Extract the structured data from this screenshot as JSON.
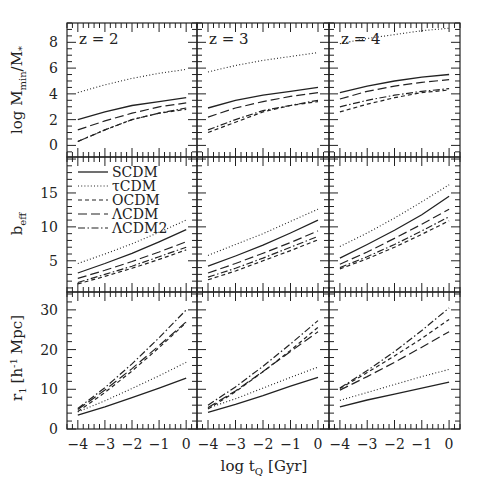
{
  "chart_data": {
    "type": "line",
    "title": "",
    "xlabel": "log t_Q [Gyr]",
    "x": [
      -4,
      -3,
      -2,
      -1,
      0
    ],
    "xlim": [
      -4.4,
      0.4
    ],
    "xticks": [
      -4,
      -3,
      -2,
      -1,
      0
    ],
    "columns": [
      "z = 2",
      "z = 3",
      "z = 4"
    ],
    "rows": [
      {
        "key": "mmin",
        "ylabel": "log M_min/M_*",
        "ylim": [
          -0.9,
          9.5
        ],
        "yticks": [
          0,
          2,
          4,
          6,
          8
        ]
      },
      {
        "key": "beff",
        "ylabel": "b_eff",
        "ylim": [
          0.4,
          20.3
        ],
        "yticks": [
          5,
          10,
          15
        ]
      },
      {
        "key": "r1",
        "ylabel": "r_1 [h^-1 Mpc]",
        "ylim": [
          0,
          34.5
        ],
        "yticks": [
          0,
          10,
          20,
          30
        ]
      }
    ],
    "legend": [
      {
        "name": "SCDM",
        "style": "solid"
      },
      {
        "name": "τCDM",
        "style": "dotted"
      },
      {
        "name": "OCDM",
        "style": "short-dash"
      },
      {
        "name": "ΛCDM",
        "style": "long-dash"
      },
      {
        "name": "ΛCDM2",
        "style": "dash-dot"
      }
    ],
    "legend_position": "middle-left panel, upper left",
    "grid": false,
    "panels": {
      "mmin": [
        {
          "z": 2,
          "series": [
            {
              "name": "SCDM",
              "values": [
                2.0,
                2.6,
                3.1,
                3.4,
                3.7
              ]
            },
            {
              "name": "τCDM",
              "values": [
                4.1,
                4.7,
                5.2,
                5.6,
                5.9
              ]
            },
            {
              "name": "OCDM",
              "values": [
                0.3,
                1.2,
                2.0,
                2.5,
                2.8
              ]
            },
            {
              "name": "ΛCDM",
              "values": [
                1.2,
                1.9,
                2.5,
                3.0,
                3.3
              ]
            },
            {
              "name": "ΛCDM2",
              "values": [
                0.3,
                1.2,
                2.0,
                2.5,
                2.9
              ]
            }
          ]
        },
        {
          "z": 3,
          "series": [
            {
              "name": "SCDM",
              "values": [
                2.9,
                3.5,
                3.9,
                4.2,
                4.5
              ]
            },
            {
              "name": "τCDM",
              "values": [
                5.7,
                6.2,
                6.6,
                6.9,
                7.2
              ]
            },
            {
              "name": "OCDM",
              "values": [
                1.0,
                1.8,
                2.6,
                3.1,
                3.4
              ]
            },
            {
              "name": "ΛCDM",
              "values": [
                2.2,
                2.9,
                3.4,
                3.8,
                4.1
              ]
            },
            {
              "name": "ΛCDM2",
              "values": [
                1.2,
                2.0,
                2.7,
                3.1,
                3.5
              ]
            }
          ]
        },
        {
          "z": 4,
          "series": [
            {
              "name": "SCDM",
              "values": [
                4.1,
                4.6,
                5.0,
                5.3,
                5.5
              ]
            },
            {
              "name": "τCDM",
              "values": [
                7.9,
                8.3,
                8.6,
                8.9,
                9.1
              ]
            },
            {
              "name": "OCDM",
              "values": [
                2.6,
                3.2,
                3.7,
                4.1,
                4.3
              ]
            },
            {
              "name": "ΛCDM",
              "values": [
                3.6,
                4.2,
                4.6,
                4.9,
                5.1
              ]
            },
            {
              "name": "ΛCDM2",
              "values": [
                3.0,
                3.5,
                3.9,
                4.2,
                4.4
              ]
            }
          ]
        }
      ],
      "beff": [
        {
          "z": 2,
          "series": [
            {
              "name": "SCDM",
              "values": [
                3.2,
                4.6,
                6.1,
                7.8,
                9.6
              ]
            },
            {
              "name": "τCDM",
              "values": [
                4.6,
                6.0,
                7.5,
                9.2,
                11.0
              ]
            },
            {
              "name": "OCDM",
              "values": [
                1.6,
                2.7,
                3.9,
                5.2,
                6.6
              ]
            },
            {
              "name": "ΛCDM",
              "values": [
                2.4,
                3.6,
                4.9,
                6.3,
                7.8
              ]
            },
            {
              "name": "ΛCDM2",
              "values": [
                1.8,
                3.0,
                4.2,
                5.6,
                7.0
              ]
            }
          ]
        },
        {
          "z": 3,
          "series": [
            {
              "name": "SCDM",
              "values": [
                4.2,
                5.7,
                7.3,
                9.1,
                11.0
              ]
            },
            {
              "name": "τCDM",
              "values": [
                5.8,
                7.4,
                9.0,
                10.8,
                12.6
              ]
            },
            {
              "name": "OCDM",
              "values": [
                2.2,
                3.5,
                5.0,
                6.5,
                8.1
              ]
            },
            {
              "name": "ΛCDM",
              "values": [
                3.2,
                4.6,
                6.1,
                7.7,
                9.4
              ]
            },
            {
              "name": "ΛCDM2",
              "values": [
                2.6,
                3.9,
                5.4,
                7.0,
                8.6
              ]
            }
          ]
        },
        {
          "z": 4,
          "series": [
            {
              "name": "SCDM",
              "values": [
                5.4,
                7.4,
                9.5,
                11.8,
                14.5
              ]
            },
            {
              "name": "τCDM",
              "values": [
                7.1,
                9.1,
                11.3,
                13.7,
                16.2
              ]
            },
            {
              "name": "OCDM",
              "values": [
                3.8,
                5.3,
                7.0,
                8.9,
                10.9
              ]
            },
            {
              "name": "ΛCDM",
              "values": [
                4.5,
                6.3,
                8.3,
                10.4,
                12.6
              ]
            },
            {
              "name": "ΛCDM2",
              "values": [
                4.0,
                5.6,
                7.4,
                9.4,
                11.5
              ]
            }
          ]
        }
      ],
      "r1": [
        {
          "z": 2,
          "series": [
            {
              "name": "SCDM",
              "values": [
                3.5,
                5.6,
                7.9,
                10.3,
                12.8
              ]
            },
            {
              "name": "τCDM",
              "values": [
                4.3,
                7.1,
                10.2,
                13.4,
                16.8
              ]
            },
            {
              "name": "OCDM",
              "values": [
                4.4,
                9.2,
                14.6,
                20.5,
                26.8
              ]
            },
            {
              "name": "ΛCDM",
              "values": [
                4.9,
                9.8,
                15.2,
                21.0,
                27.0
              ]
            },
            {
              "name": "ΛCDM2",
              "values": [
                5.2,
                10.4,
                16.4,
                23.0,
                30.0
              ]
            }
          ]
        },
        {
          "z": 3,
          "series": [
            {
              "name": "SCDM",
              "values": [
                4.2,
                6.2,
                8.4,
                10.8,
                13.0
              ]
            },
            {
              "name": "τCDM",
              "values": [
                5.3,
                7.6,
                10.3,
                13.0,
                15.6
              ]
            },
            {
              "name": "OCDM",
              "values": [
                5.0,
                9.4,
                14.4,
                19.8,
                25.6
              ]
            },
            {
              "name": "ΛCDM",
              "values": [
                5.4,
                9.6,
                14.5,
                19.5,
                24.5
              ]
            },
            {
              "name": "ΛCDM2",
              "values": [
                6.0,
                10.6,
                15.8,
                21.4,
                27.3
              ]
            }
          ]
        },
        {
          "z": 4,
          "series": [
            {
              "name": "SCDM",
              "values": [
                5.6,
                7.3,
                8.8,
                10.3,
                11.8
              ]
            },
            {
              "name": "τCDM",
              "values": [
                7.2,
                9.2,
                11.2,
                13.2,
                15.0
              ]
            },
            {
              "name": "OCDM",
              "values": [
                10.2,
                14.2,
                18.4,
                22.8,
                27.6
              ]
            },
            {
              "name": "ΛCDM",
              "values": [
                9.8,
                13.2,
                16.8,
                20.6,
                24.5
              ]
            },
            {
              "name": "ΛCDM2",
              "values": [
                10.3,
                14.7,
                19.5,
                24.8,
                30.5
              ]
            }
          ]
        }
      ]
    }
  },
  "labels": {
    "x_axis_title": "log t",
    "x_axis_sub": "Q",
    "x_axis_unit": "[Gyr]",
    "ylabel_top_main": "log M",
    "ylabel_top_sub": "min",
    "ylabel_top_rest": "/M",
    "ylabel_top_sub2": "*",
    "ylabel_mid_main": "b",
    "ylabel_mid_sub": "eff",
    "ylabel_bot_main": "r",
    "ylabel_bot_sub": "1",
    "ylabel_bot_rest": "[h",
    "ylabel_bot_sup": "-1",
    "ylabel_bot_unit": "Mpc]"
  },
  "colors": {
    "ink": "#222222",
    "background": "#ffffff"
  }
}
